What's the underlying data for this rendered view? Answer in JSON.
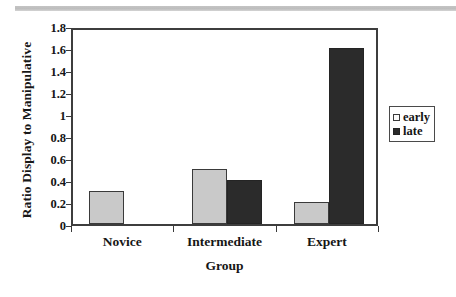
{
  "chart_data": {
    "type": "bar",
    "title": "",
    "xlabel": "Group",
    "ylabel": "Ratio Display to Manipulative",
    "categories": [
      "Novice",
      "Intermediate",
      "Expert"
    ],
    "series": [
      {
        "name": "early",
        "values": [
          0.3,
          0.5,
          0.2
        ],
        "color": "#c9c9c9"
      },
      {
        "name": "late",
        "values": [
          0.0,
          0.4,
          1.6
        ],
        "color": "#2b2b2b"
      }
    ],
    "ylim": [
      0,
      1.8
    ],
    "ytick_step": 0.2,
    "ytick_labels": [
      "0",
      "0.2",
      "0.4",
      "0.6",
      "0.8",
      "1",
      "1.2",
      "1.4",
      "1.6",
      "1.8"
    ],
    "ytick_values": [
      0,
      0.2,
      0.4,
      0.6,
      0.8,
      1.0,
      1.2,
      1.4,
      1.6,
      1.8
    ],
    "grid": false,
    "legend_position": "right"
  },
  "legend": {
    "entries": [
      {
        "label": "early",
        "swatch": "open-square-icon"
      },
      {
        "label": "late",
        "swatch": "filled-square-icon"
      }
    ]
  },
  "axes": {
    "x_title": "Group",
    "y_title": "Ratio Display to Manipulative"
  }
}
